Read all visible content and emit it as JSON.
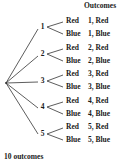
{
  "header": {
    "outcomes_label": "Outcomes"
  },
  "tree": {
    "root": {
      "x": 6,
      "y": 83
    },
    "first_stage": [
      {
        "label": "1",
        "y": 27,
        "children": [
          {
            "label": "Red",
            "outcome": "1, Red",
            "y": 21
          },
          {
            "label": "Blue",
            "outcome": "1, Blue",
            "y": 34
          }
        ]
      },
      {
        "label": "2",
        "y": 54,
        "children": [
          {
            "label": "Red",
            "outcome": "2, Red",
            "y": 48
          },
          {
            "label": "Blue",
            "outcome": "2, Blue",
            "y": 61
          }
        ]
      },
      {
        "label": "3",
        "y": 81,
        "children": [
          {
            "label": "Red",
            "outcome": "3, Red",
            "y": 74
          },
          {
            "label": "Blue",
            "outcome": "3, Blue",
            "y": 87
          }
        ]
      },
      {
        "label": "4",
        "y": 107,
        "children": [
          {
            "label": "Red",
            "outcome": "4, Red",
            "y": 101
          },
          {
            "label": "Blue",
            "outcome": "4, Blue",
            "y": 114
          }
        ]
      },
      {
        "label": "5",
        "y": 134,
        "children": [
          {
            "label": "Red",
            "outcome": "5, Red",
            "y": 127
          },
          {
            "label": "Blue",
            "outcome": "5, Blue",
            "y": 140
          }
        ]
      }
    ]
  },
  "footer": {
    "summary": "10 outcomes"
  },
  "colors": {
    "line": "#333333",
    "text": "#1a1a1a",
    "background": "#ffffff"
  }
}
